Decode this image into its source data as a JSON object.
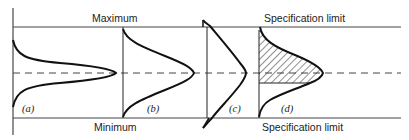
{
  "diagram": {
    "type": "distribution-vs-limits",
    "labels": {
      "top_left": "Maximum",
      "bottom_left": "Minimum",
      "top_right": "Specification limit",
      "bottom_right": "Specification limit"
    },
    "panels": [
      {
        "id": "a",
        "label": "(a)",
        "description": "narrow distribution within maximum/minimum"
      },
      {
        "id": "b",
        "label": "(b)",
        "description": "distribution spanning maximum to minimum"
      },
      {
        "id": "c",
        "label": "(c)",
        "description": "distribution exceeding limits"
      },
      {
        "id": "d",
        "label": "(d)",
        "description": "distribution with hatched upper portion"
      }
    ],
    "colors": {
      "line": "#111111",
      "background": "#ffffff"
    }
  }
}
